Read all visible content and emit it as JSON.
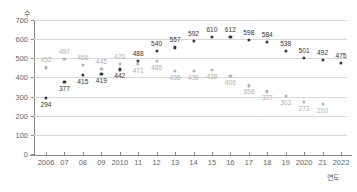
{
  "chart_data": {
    "type": "scatter",
    "title": "",
    "xlabel": "연도",
    "ylabel": "수",
    "grid": true,
    "legend": "none",
    "ylim": [
      0,
      700
    ],
    "yticks": [
      0,
      100,
      200,
      300,
      400,
      500,
      600,
      700
    ],
    "ytick_labels": [
      "0",
      "100",
      "200",
      "300",
      "400",
      "500",
      "600",
      "700"
    ],
    "categories": [
      "2006",
      "07",
      "08",
      "09",
      "2010",
      "11",
      "12",
      "13",
      "14",
      "15",
      "16",
      "17",
      "18",
      "19",
      "2020",
      "21",
      "2022"
    ],
    "x": [
      2006,
      2007,
      2008,
      2009,
      2010,
      2011,
      2012,
      2013,
      2014,
      2015,
      2016,
      2017,
      2018,
      2019,
      2020,
      2021,
      2022
    ],
    "series": [
      {
        "name": "series-black",
        "color": "#3a3a3a",
        "values": [
          294,
          377,
          415,
          419,
          442,
          488,
          540,
          557,
          592,
          610,
          612,
          598,
          584,
          538,
          501,
          492,
          475
        ],
        "label_positions": [
          "below",
          "below",
          "below",
          "below",
          "below",
          "above",
          "above",
          "above",
          "above",
          "above",
          "above",
          "above",
          "above",
          "above",
          "above",
          "above",
          "above"
        ]
      },
      {
        "name": "series-gray",
        "color": "#b3b3b3",
        "values": [
          452,
          497,
          466,
          445,
          470,
          471,
          485,
          436,
          436,
          438,
          406,
          358,
          327,
          303,
          272,
          260,
          null
        ],
        "label_positions": [
          "above",
          "above",
          "above",
          "above",
          "above",
          "below",
          "below",
          "below",
          "below",
          "below",
          "below",
          "below",
          "below",
          "below",
          "below",
          "below",
          null
        ]
      }
    ]
  },
  "axis": {
    "y_title": "수",
    "x_title": "연도"
  }
}
